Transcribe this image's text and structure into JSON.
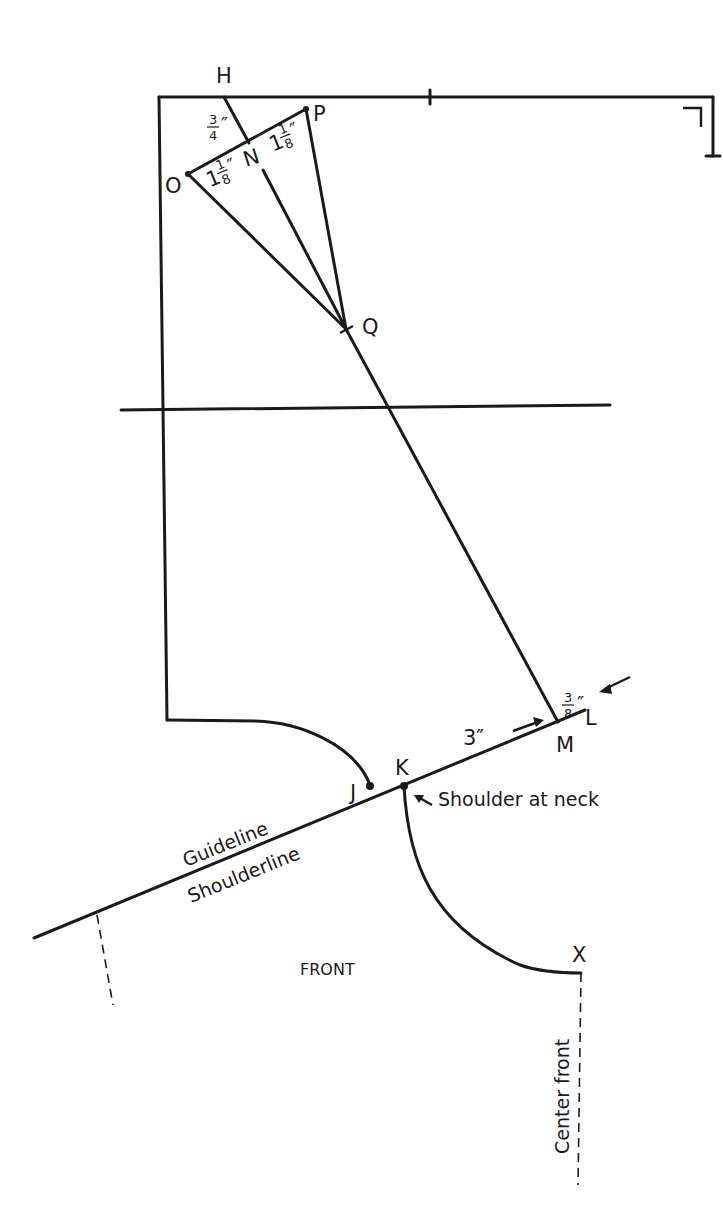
{
  "diagram": {
    "points": {
      "H": "H",
      "P": "P",
      "O": "O",
      "N": "N",
      "Q": "Q",
      "J": "J",
      "K": "K",
      "L": "L",
      "M": "M",
      "X": "X"
    },
    "measurements": {
      "h_to_n": {
        "whole": "",
        "num": "3",
        "den": "4",
        "unit": "″"
      },
      "o_to_n": {
        "whole": "1",
        "num": "1",
        "den": "8",
        "unit": "″"
      },
      "n_to_p": {
        "whole": "1",
        "num": "1",
        "den": "8",
        "unit": "″"
      },
      "m_to_l": {
        "whole": "",
        "num": "3",
        "den": "8",
        "unit": "″"
      },
      "k_to_m": "3″"
    },
    "labels": {
      "shoulder_at_neck": "Shoulder at neck",
      "guideline": "Guideline",
      "shoulderline": "Shoulderline",
      "front": "FRONT",
      "center_front": "Center front"
    }
  }
}
